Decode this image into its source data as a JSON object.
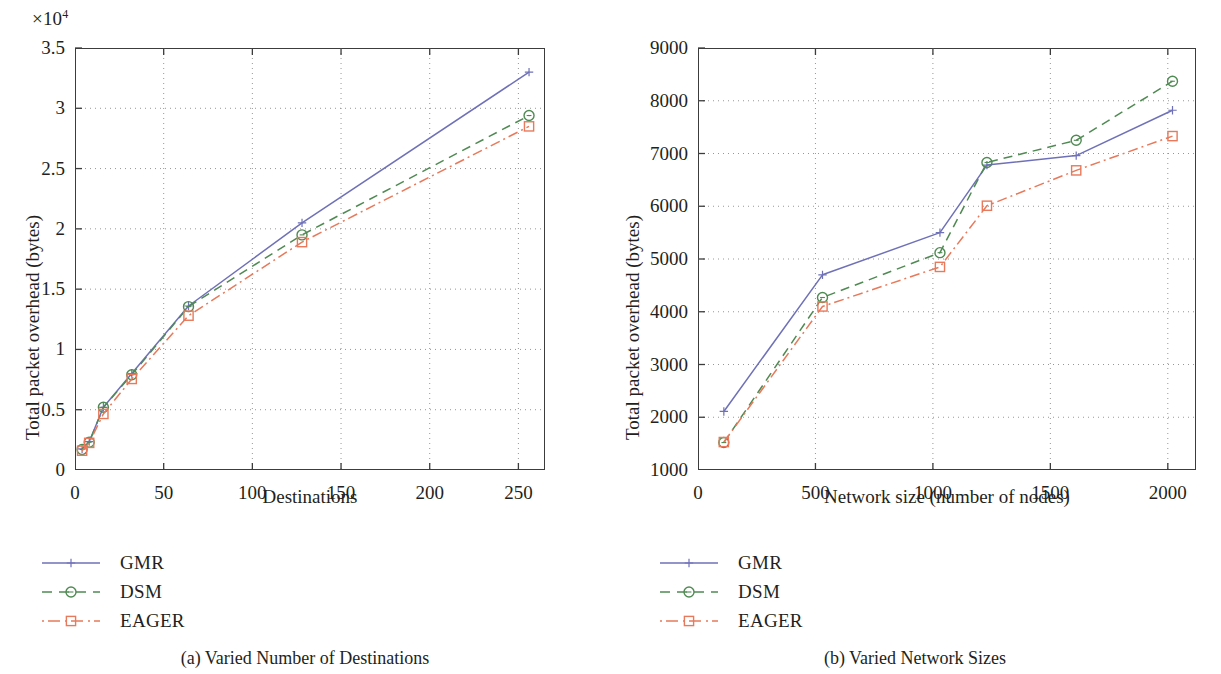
{
  "figure": {
    "panels": [
      {
        "caption": "(a)  Varied Number of Destinations",
        "multiplier": "×10",
        "multiplier_exp": "4"
      },
      {
        "caption": "(b)  Varied Network Sizes"
      }
    ]
  },
  "legend": {
    "series": [
      {
        "label": "GMR",
        "color": "#6f71b8",
        "style": "solid",
        "marker": "plus"
      },
      {
        "label": "DSM",
        "color": "#4f8a52",
        "style": "dashed",
        "marker": "circle"
      },
      {
        "label": "EAGER",
        "color": "#e8795a",
        "style": "dashdot",
        "marker": "square"
      }
    ]
  },
  "chart_data": [
    {
      "type": "line",
      "title": "(a)  Varied Number of Destinations",
      "xlabel": "Destinations",
      "ylabel": "Total packet overhead (bytes)",
      "y_multiplier": "×10⁴",
      "xlim": [
        0,
        265
      ],
      "ylim": [
        0,
        35000
      ],
      "xticks": [
        0,
        50,
        100,
        150,
        200,
        250
      ],
      "xtick_labels": [
        "0",
        "50",
        "100",
        "150",
        "200",
        "250"
      ],
      "yticks": [
        0,
        5000,
        10000,
        15000,
        20000,
        25000,
        30000,
        35000
      ],
      "ytick_labels": [
        "0",
        "0.5",
        "1",
        "1.5",
        "2",
        "2.5",
        "3",
        "3.5"
      ],
      "grid": true,
      "legend_position": "below-left",
      "x": [
        4,
        8,
        16,
        32,
        64,
        128,
        256
      ],
      "series": [
        {
          "name": "GMR",
          "values": [
            1750,
            2350,
            5200,
            8000,
            13600,
            20500,
            33000
          ]
        },
        {
          "name": "DSM",
          "values": [
            1700,
            2300,
            5200,
            7900,
            13550,
            19500,
            29400
          ]
        },
        {
          "name": "EAGER",
          "values": [
            1600,
            2250,
            4650,
            7550,
            12800,
            18900,
            28500
          ]
        }
      ]
    },
    {
      "type": "line",
      "title": "(b)  Varied Network Sizes",
      "xlabel": "Network size (number of nodes)",
      "ylabel": "Total packet overhead (bytes)",
      "xlim": [
        0,
        2120
      ],
      "ylim": [
        1000,
        9000
      ],
      "xticks": [
        0,
        500,
        1000,
        1500,
        2000
      ],
      "xtick_labels": [
        "0",
        "500",
        "1000",
        "1500",
        "2000"
      ],
      "yticks": [
        1000,
        2000,
        3000,
        4000,
        5000,
        6000,
        7000,
        8000,
        9000
      ],
      "ytick_labels": [
        "1000",
        "2000",
        "3000",
        "4000",
        "5000",
        "6000",
        "7000",
        "8000",
        "9000"
      ],
      "grid": true,
      "legend_position": "below-left",
      "x": [
        110,
        530,
        1030,
        1230,
        1610,
        2020
      ],
      "series": [
        {
          "name": "GMR",
          "values": [
            2110,
            4700,
            5500,
            6780,
            6960,
            7820
          ]
        },
        {
          "name": "DSM",
          "values": [
            1520,
            4270,
            5120,
            6830,
            7250,
            8370
          ]
        },
        {
          "name": "EAGER",
          "values": [
            1530,
            4100,
            4850,
            6010,
            6680,
            7330
          ]
        }
      ]
    }
  ]
}
